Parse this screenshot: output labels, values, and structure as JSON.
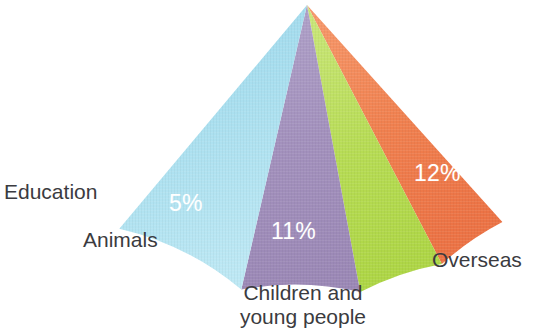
{
  "chart_data": {
    "type": "pie",
    "title": "",
    "subtitle": "",
    "xlabel": "",
    "ylabel": "",
    "legend_position": "none",
    "grid": false,
    "note": "Partial fan / cone-shaped pie chart showing five labelled wedges, total shown 32%",
    "shape": {
      "apex_x": 307,
      "apex_y": 5,
      "radius": 292,
      "start_angle_deg": 228,
      "end_angle_deg": 310,
      "total_sweep_deg": 82
    },
    "categories": [
      "Education",
      "Animals",
      "Children and young people",
      "Overseas",
      "Unlabelled"
    ],
    "values": [
      4,
      5,
      11,
      12,
      0
    ],
    "value_labels": [
      "4%",
      "5%",
      "11%",
      "12%",
      ""
    ],
    "colors": [
      "#f0804f",
      "#b7dc55",
      "#a391bd",
      "#a4dcee",
      "#f0804f"
    ],
    "slices": [
      {
        "name": "Education",
        "label": "Education",
        "value": 4,
        "value_label": "4%",
        "color": "#f0804f",
        "start_angle_deg": 228.0,
        "end_angle_deg": 242.5
      },
      {
        "name": "Animals",
        "label": "Animals",
        "value": 5,
        "value_label": "5%",
        "color": "#b7dc55",
        "start_angle_deg": 242.5,
        "end_angle_deg": 259.5
      },
      {
        "name": "Children and young people",
        "label": "Children and young people",
        "label_line1": "Children and",
        "label_line2": "young people",
        "value": 11,
        "value_label": "11%",
        "color": "#a391bd",
        "start_angle_deg": 259.5,
        "end_angle_deg": 283.0
      },
      {
        "name": "Overseas",
        "label": "Overseas",
        "value": 12,
        "value_label": "12%",
        "color": "#a4dcee",
        "start_angle_deg": 283.0,
        "end_angle_deg": 310.0
      }
    ]
  },
  "chart": {
    "background": "#ffffff",
    "value_text_color": "#ffffff",
    "category_text_color": "#3b3b40"
  }
}
